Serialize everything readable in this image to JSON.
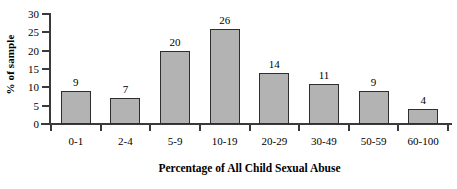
{
  "chart_data": {
    "type": "bar",
    "title": "",
    "xlabel": "Percentage of All Child Sexual Abuse",
    "ylabel": "% of sample",
    "categories": [
      "0-1",
      "2-4",
      "5-9",
      "10-19",
      "20-29",
      "30-49",
      "50-59",
      "60-100"
    ],
    "values": [
      9,
      7,
      20,
      26,
      14,
      11,
      9,
      4
    ],
    "data_labels": [
      "9",
      "7",
      "20",
      "26",
      "14",
      "11",
      "9",
      "4"
    ],
    "ylim": [
      0,
      30
    ],
    "ytick_labels": [
      "30",
      "25",
      "20",
      "15",
      "10",
      "5",
      "0"
    ],
    "ytick_values": [
      30,
      25,
      20,
      15,
      10,
      5,
      0
    ],
    "grid": false,
    "legend": "none",
    "bar_fill_color": "#b3b3b3",
    "bar_border_color": "#2e2e2e",
    "axis_color": "#3a3a3a",
    "background_color": "#ffffff"
  }
}
